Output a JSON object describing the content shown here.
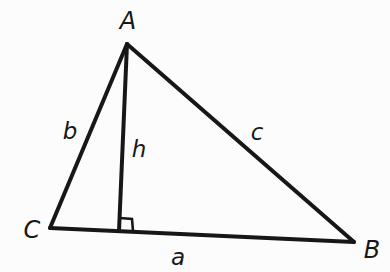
{
  "figure": {
    "name": "triangle-with-altitude",
    "background_color": "#fcfcfc",
    "stroke_color": "#171717",
    "width": 390,
    "height": 272
  },
  "vertices": [
    {
      "id": "A",
      "label": "A",
      "x": 127,
      "y": 44,
      "label_x": 128,
      "label_y": 21
    },
    {
      "id": "B",
      "label": "B",
      "x": 354,
      "y": 242,
      "label_x": 372,
      "label_y": 250
    },
    {
      "id": "C",
      "label": "C",
      "x": 50,
      "y": 228,
      "label_x": 32,
      "label_y": 230
    }
  ],
  "sides": [
    {
      "id": "a",
      "label": "a",
      "from": "C",
      "to": "B",
      "label_x": 178,
      "label_y": 257
    },
    {
      "id": "b",
      "label": "b",
      "from": "C",
      "to": "A",
      "label_x": 70,
      "label_y": 131
    },
    {
      "id": "c",
      "label": "c",
      "from": "A",
      "to": "B",
      "label_x": 257,
      "label_y": 132
    }
  ],
  "altitude": {
    "id": "h",
    "label": "h",
    "from": "A",
    "foot_x": 119,
    "foot_y": 230,
    "label_x": 139,
    "label_y": 149
  },
  "right_angle_marker": {
    "name": "right-angle-square",
    "x": 119,
    "y": 230,
    "size": 12
  }
}
